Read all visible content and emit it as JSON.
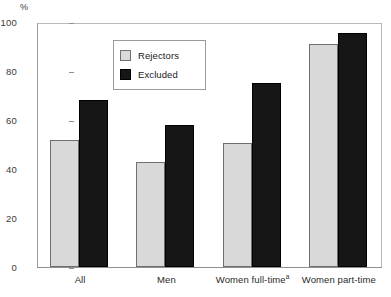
{
  "chart_data": {
    "type": "bar",
    "title": "",
    "subtitle": "",
    "xlabel": "",
    "ylabel": "%",
    "ylim": [
      0,
      100
    ],
    "yticks": [
      0,
      20,
      40,
      60,
      80,
      100
    ],
    "grid": false,
    "legend_position": "upper-left-inside",
    "categories": [
      "All",
      "Men",
      "Women full-time",
      "Women part-time"
    ],
    "category_footnotes": [
      "",
      "",
      "a",
      ""
    ],
    "series": [
      {
        "name": "Rejectors",
        "color": "#d9d9d9",
        "values": [
          52,
          43,
          50.5,
          91
        ]
      },
      {
        "name": "Excluded",
        "color": "#161616",
        "values": [
          68,
          58,
          75,
          95.5
        ]
      }
    ]
  },
  "axis": {
    "unit_label": "%",
    "tick_labels": [
      "100",
      "80",
      "60",
      "40",
      "20",
      "0"
    ]
  },
  "legend": {
    "items": [
      {
        "label": "Rejectors",
        "swatch": "rejectors"
      },
      {
        "label": "Excluded",
        "swatch": "excluded"
      }
    ]
  }
}
